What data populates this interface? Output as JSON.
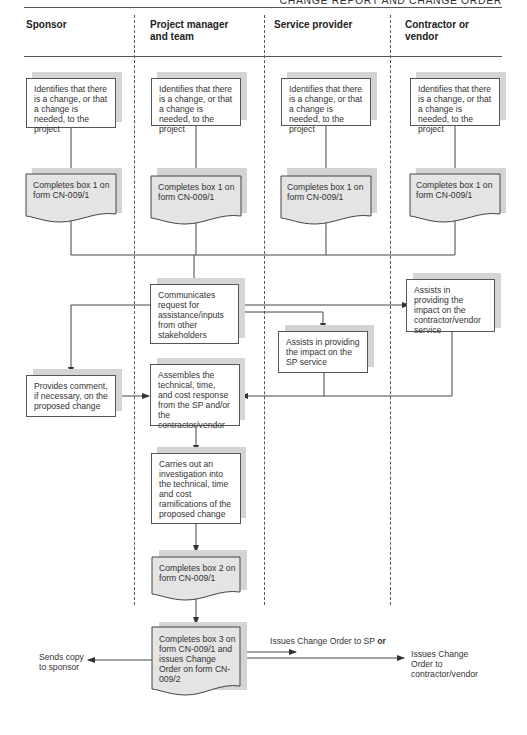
{
  "page": {
    "running_head": "CHANGE REPORT AND CHANGE ORDER"
  },
  "lanes": [
    {
      "id": "sponsor",
      "title": "Sponsor"
    },
    {
      "id": "pm",
      "title": "Project manager and team"
    },
    {
      "id": "sp",
      "title": "Service provider"
    },
    {
      "id": "cv",
      "title": "Contractor or vendor"
    }
  ],
  "nodes": {
    "sponsor_identify": "Identifies that there is a change, or that a change is needed, to the project",
    "pm_identify": "Identifies that there is a change, or that a change is needed, to the project",
    "sp_identify": "Identifies that there is a change, or that a change is needed, to the project",
    "cv_identify": "Identifies that there is a change, or that a change is needed, to the project",
    "sponsor_box1": "Completes box 1 on form CN-009/1",
    "pm_box1": "Completes box 1 on form CN-009/1",
    "sp_box1": "Completes box 1 on form CN-009/1",
    "cv_box1": "Completes box 1 on form CN-009/1",
    "pm_communicate": "Communicates request for assistance/inputs from other stakeholders",
    "cv_assist": "Assists in providing the impact on the contractor/vendor service",
    "sp_assist": "Assists in providing the impact on the SP service",
    "sponsor_comment": "Provides comment, if necessary, on the proposed change",
    "pm_assemble": "Assembles the technical, time, and cost response from the SP and/or the contractor/vendor",
    "pm_investigate": "Carries out an investigation into the technical, time and cost ramifications of the proposed change",
    "pm_box2": "Completes box 2 on form CN-009/1",
    "pm_box3": "Completes box 3 on form CN-009/1 and issues Change Order on form CN-009/2"
  },
  "outputs": {
    "sends_copy": "Sends copy to sponsor",
    "issue_sp": "Issues Change Order to SP",
    "issue_sp_or": "or",
    "issue_cv": "Issues Change Order to contractor/vendor"
  },
  "colors": {
    "line": "#444444",
    "shadow": "#d4d4d4",
    "document_fill": "#e4e4e4",
    "box_fill": "#ffffff"
  }
}
